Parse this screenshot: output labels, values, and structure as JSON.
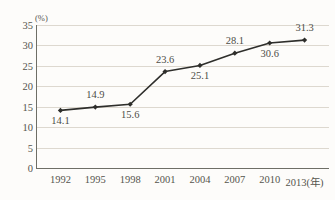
{
  "chart_data": {
    "type": "line",
    "title": "",
    "subtitle": "",
    "xlabel": "(年)",
    "ylabel": "",
    "unit_label": "(%)",
    "categories": [
      "1992",
      "1995",
      "1998",
      "2001",
      "2004",
      "2007",
      "2010",
      "2013"
    ],
    "x_tick_labels": [
      "1992",
      "1995",
      "1998",
      "2001",
      "2004",
      "2007",
      "2010",
      "2013(年)"
    ],
    "values": [
      14.1,
      14.9,
      15.6,
      23.6,
      25.1,
      28.1,
      30.6,
      31.3
    ],
    "data_labels": [
      "14.1",
      "14.9",
      "15.6",
      "23.6",
      "25.1",
      "28.1",
      "30.6",
      "31.3"
    ],
    "label_positions": [
      "below",
      "above",
      "below",
      "above",
      "below",
      "above",
      "below",
      "above"
    ],
    "ylim": [
      0,
      35
    ],
    "y_ticks": [
      0,
      5,
      10,
      15,
      20,
      25,
      30,
      35
    ],
    "y_tick_labels": [
      "0",
      "5",
      "10",
      "15",
      "20",
      "25",
      "30",
      "35"
    ],
    "grid": true,
    "legend": "none",
    "marker": "diamond",
    "series": [
      {
        "name": "",
        "values": [
          14.1,
          14.9,
          15.6,
          23.6,
          25.1,
          28.1,
          30.6,
          31.3
        ]
      }
    ]
  },
  "style": {
    "line_color": "#2e2e2b",
    "marker_color": "#2e2e2b",
    "grid_color": "#ddd8cf",
    "axis_color": "#6e6e66",
    "text_color": "#55544d",
    "background": "#fdfcfa"
  }
}
